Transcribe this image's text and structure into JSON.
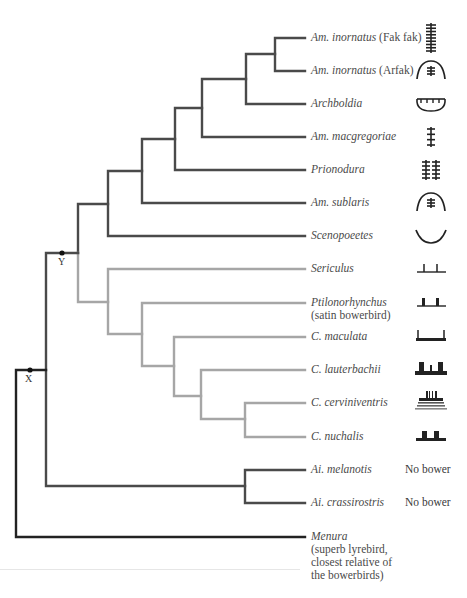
{
  "figure": {
    "colors": {
      "main_branch": "#222222",
      "dark_clade": "#4a4a4a",
      "gray_clade": "#a6a6a6",
      "icon": "#222222"
    },
    "nodes": [
      {
        "id": "X",
        "label": "X"
      },
      {
        "id": "Y",
        "label": "Y"
      }
    ],
    "taxa": [
      {
        "name": "Am. inornatus",
        "note": " (Fak fak)",
        "clade": "dark",
        "bower_icon": "maypole-tall-icon",
        "bower_text": ""
      },
      {
        "name": "Am. inornatus",
        "note": " (Arfak)",
        "clade": "dark",
        "bower_icon": "hut-maypole-icon",
        "bower_text": ""
      },
      {
        "name": "Archboldia",
        "note": "",
        "clade": "dark",
        "bower_icon": "mat-bowl-icon",
        "bower_text": ""
      },
      {
        "name": "Am. macgregoriae",
        "note": "",
        "clade": "dark",
        "bower_icon": "maypole-small-icon",
        "bower_text": ""
      },
      {
        "name": "Prionodura",
        "note": "",
        "clade": "dark",
        "bower_icon": "double-maypole-icon",
        "bower_text": ""
      },
      {
        "name": "Am. sublaris",
        "note": "",
        "clade": "dark",
        "bower_icon": "hut-maypole-icon",
        "bower_text": ""
      },
      {
        "name": "Scenopoeetes",
        "note": "",
        "clade": "dark",
        "bower_icon": "court-bowl-icon",
        "bower_text": ""
      },
      {
        "name": "Sericulus",
        "note": "",
        "clade": "gray",
        "bower_icon": "avenue-thin-icon",
        "bower_text": ""
      },
      {
        "name": "Ptilonorhynchus",
        "note": "(satin bowerbird)",
        "clade": "gray",
        "bower_icon": "avenue-icon",
        "bower_text": ""
      },
      {
        "name": "C. maculata",
        "note": "",
        "clade": "gray",
        "bower_icon": "avenue-long-icon",
        "bower_text": ""
      },
      {
        "name": "C. lauterbachii",
        "note": "",
        "clade": "gray",
        "bower_icon": "double-avenue-icon",
        "bower_text": ""
      },
      {
        "name": "C. cerviniventris",
        "note": "",
        "clade": "gray",
        "bower_icon": "avenue-platform-icon",
        "bower_text": ""
      },
      {
        "name": "C. nuchalis",
        "note": "",
        "clade": "gray",
        "bower_icon": "avenue-wide-icon",
        "bower_text": ""
      },
      {
        "name": "Ai. melanotis",
        "note": "",
        "clade": "dark",
        "bower_icon": "",
        "bower_text": "No bower"
      },
      {
        "name": "Ai. crassirostris",
        "note": "",
        "clade": "dark",
        "bower_icon": "",
        "bower_text": "No bower"
      },
      {
        "name": "Menura",
        "note": "(superb lyrebird, closest relative of the bowerbirds)",
        "note_lines": [
          "(superb lyrebird,",
          "closest relative of",
          "the bowerbirds)"
        ],
        "clade": "root",
        "bower_icon": "",
        "bower_text": ""
      }
    ]
  }
}
